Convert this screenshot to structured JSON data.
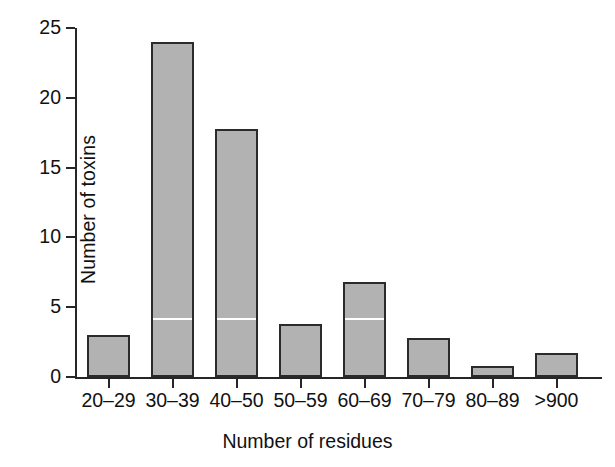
{
  "chart_data": {
    "type": "bar",
    "title": "",
    "xlabel": "Number of residues",
    "ylabel": "Number of toxins",
    "categories": [
      "20–29",
      "30–39",
      "40–50",
      "50–59",
      "60–69",
      "70–79",
      "80–89",
      ">900"
    ],
    "values": [
      3,
      24,
      17.8,
      3.8,
      6.8,
      2.8,
      0.8,
      1.7
    ],
    "ylim": [
      0,
      25
    ],
    "yticks": [
      0,
      5,
      10,
      15,
      20,
      25
    ],
    "ytick_labels": [
      "0",
      "5",
      "10",
      "15",
      "20",
      "25"
    ],
    "grid": false,
    "legend": "none",
    "bar_color": "#b2b2b2",
    "bar_edge_color": "#2b2b2b",
    "axis_color": "#262626",
    "background": "#ffffff",
    "annotations": [
      {
        "name": "scanline",
        "category": "30–39",
        "y": 4
      },
      {
        "name": "scanline",
        "category": "40–50",
        "y": 4
      },
      {
        "name": "scanline",
        "category": "60–69",
        "y": 4
      }
    ]
  }
}
